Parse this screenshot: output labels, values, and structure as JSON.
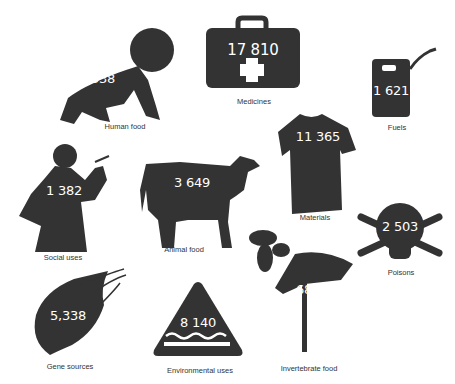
{
  "colors": {
    "silhouette": "#333333",
    "number_text": "#ffffff",
    "label_text": "#333333",
    "background": "#ffffff"
  },
  "items": [
    {
      "id": "human-food",
      "icon": "baby-icon",
      "value": "5 538",
      "label": "Human food"
    },
    {
      "id": "medicines",
      "icon": "first-aid-kit-icon",
      "value": "17 810",
      "label": "Medicines"
    },
    {
      "id": "fuels",
      "icon": "jerrycan-icon",
      "value": "1 621",
      "label": "Fuels"
    },
    {
      "id": "materials",
      "icon": "tshirt-icon",
      "value": "11 365",
      "label": "Materials"
    },
    {
      "id": "social-uses",
      "icon": "smoking-man-icon",
      "value": "1 382",
      "label": "Social uses"
    },
    {
      "id": "animal-food",
      "icon": "cow-icon",
      "value": "3 649",
      "label": "Animal food"
    },
    {
      "id": "poisons",
      "icon": "skull-crossbones-icon",
      "value": "2 503",
      "label": "Poisons"
    },
    {
      "id": "invertebrate-food",
      "icon": "bee-flower-icon",
      "value": "683",
      "label": "Invertebrate food"
    },
    {
      "id": "gene-sources",
      "icon": "seed-icon",
      "value": "5,338",
      "label": "Gene sources"
    },
    {
      "id": "environmental-uses",
      "icon": "water-warning-triangle-icon",
      "value": "8 140",
      "label": "Environmental uses"
    }
  ]
}
